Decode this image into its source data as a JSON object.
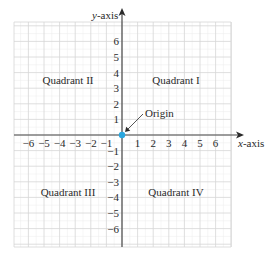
{
  "diagram": {
    "type": "coordinate-plane",
    "axes": {
      "x_label_prefix": "x",
      "x_label_suffix": "-axis",
      "y_label_prefix": "y",
      "y_label_suffix": "-axis"
    },
    "x_ticks": [
      "−6",
      "−5",
      "−4",
      "−3",
      "−2",
      "−1",
      "1",
      "2",
      "3",
      "4",
      "5",
      "6"
    ],
    "y_ticks": [
      "6",
      "5",
      "4",
      "3",
      "2",
      "1",
      "−1",
      "−2",
      "−3",
      "−4",
      "−5",
      "−6"
    ],
    "quadrants": {
      "q1": "Quadrant I",
      "q2": "Quadrant II",
      "q3": "Quadrant III",
      "q4": "Quadrant IV"
    },
    "origin_label": "Origin",
    "colors": {
      "axis": "#4a4a4a",
      "grid_major": "#d6d6d6",
      "grid_minor": "#ededed",
      "origin_dot": "#2aa7df",
      "text": "#2a2a2a"
    }
  }
}
